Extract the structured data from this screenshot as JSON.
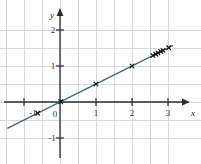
{
  "chart_data": {
    "type": "scatter",
    "title": "",
    "subtitle": "",
    "xlabel": "x",
    "ylabel": "y",
    "xlim": [
      -1.55,
      3.45
    ],
    "ylim": [
      -1.45,
      2.35
    ],
    "grid": true,
    "grid_step": 0.5,
    "grid_color": "#cfcfcf",
    "axis_color": "#2b2b2b",
    "legend": "none",
    "x_ticks": [
      -1,
      0,
      1,
      2,
      3
    ],
    "x_tick_labels": [
      "-1",
      "0",
      "1",
      "2",
      "3"
    ],
    "y_ticks": [
      -1,
      1,
      2
    ],
    "y_tick_labels": [
      "-1",
      "1",
      "2"
    ],
    "origin_label": "0",
    "series": [
      {
        "name": "data points",
        "type": "scatter",
        "marker": "cross",
        "color": "#111111",
        "x": [
          -0.62,
          0.02,
          1.0,
          2.0,
          2.58,
          2.66,
          2.72,
          2.8,
          2.86,
          3.02
        ],
        "y": [
          -0.31,
          0.01,
          0.5,
          1.0,
          1.29,
          1.33,
          1.36,
          1.4,
          1.43,
          1.51
        ]
      },
      {
        "name": "regression line",
        "type": "line",
        "color": "#3c6a74",
        "slope": 0.5,
        "intercept": 0.0,
        "x_start": -1.45,
        "x_end": 3.13,
        "y_start": -0.725,
        "y_end": 1.565
      }
    ]
  },
  "labels": {
    "x_axis_title": "x",
    "y_axis_title": "y",
    "x_neg1": "-1",
    "x_zero": "0",
    "x_1": "1",
    "x_2": "2",
    "x_3": "3",
    "y_neg1": "-1",
    "y_1": "1",
    "y_2": "2"
  }
}
